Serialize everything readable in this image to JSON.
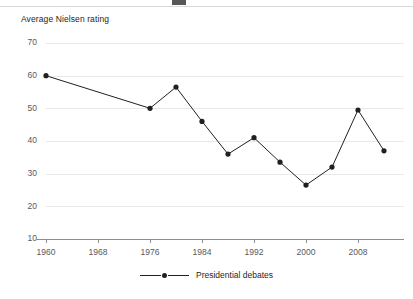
{
  "axis_title": "Average Nielsen rating",
  "legend": {
    "label": "Presidential debates",
    "marker_color": "#231f20",
    "line_color": "#231f20"
  },
  "colors": {
    "series": "#231f20",
    "grid": "#e9e9e9",
    "axis": "#8d8d8d",
    "tick_text": "#58595b",
    "title_text": "#231f20",
    "background": "#ffffff"
  },
  "y_ticks": [
    "70",
    "60",
    "50",
    "40",
    "30",
    "20",
    "10"
  ],
  "x_ticks": [
    "1960",
    "1968",
    "1976",
    "1984",
    "1992",
    "2000",
    "2008"
  ],
  "chart_data": {
    "type": "line",
    "title": "",
    "subtitle": "",
    "xlabel": "",
    "ylabel": "Average Nielsen rating",
    "ylim": [
      10,
      70
    ],
    "xlim": [
      1960,
      2012
    ],
    "y_tick_values": [
      70,
      60,
      50,
      40,
      30,
      20,
      10
    ],
    "x_tick_values": [
      1960,
      1968,
      1976,
      1984,
      1992,
      2000,
      2008
    ],
    "grid": "horizontal",
    "legend_position": "bottom-center",
    "marker": "circle",
    "series": [
      {
        "name": "Presidential debates",
        "color": "#231f20",
        "x": [
          1960,
          1976,
          1980,
          1984,
          1988,
          1992,
          1996,
          2000,
          2004,
          2008,
          2012
        ],
        "values": [
          60.0,
          50.0,
          56.5,
          46.0,
          36.0,
          41.0,
          33.5,
          26.5,
          32.0,
          49.5,
          37.0
        ],
        "note": "No debates held 1964, 1968, 1972 (gap in line)"
      }
    ]
  }
}
